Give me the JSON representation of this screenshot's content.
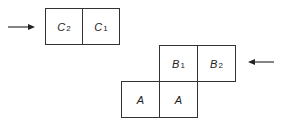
{
  "diagram": {
    "top_group": {
      "cells": [
        {
          "letter": "C",
          "sub": "2"
        },
        {
          "letter": "C",
          "sub": "1"
        }
      ],
      "arrow_direction": "right"
    },
    "bottom_group": {
      "row1": [
        {
          "letter": "B",
          "sub": "1"
        },
        {
          "letter": "B",
          "sub": "2"
        }
      ],
      "row2": [
        {
          "letter": "A",
          "sub": ""
        },
        {
          "letter": "A",
          "sub": ""
        }
      ],
      "arrow_direction": "left"
    },
    "colors": {
      "line": "#333333",
      "background": "#ffffff"
    }
  }
}
